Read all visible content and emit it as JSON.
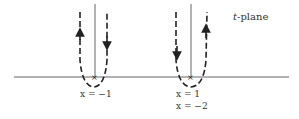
{
  "diagram": {
    "plane_label_var": "t",
    "plane_label_rest": "-plane",
    "left_label": "x = −1",
    "right_label_1": "x = 1",
    "right_label_2": "x = −2",
    "colors": {
      "line": "#555555",
      "dash": "#222222",
      "text": "#333333"
    }
  }
}
